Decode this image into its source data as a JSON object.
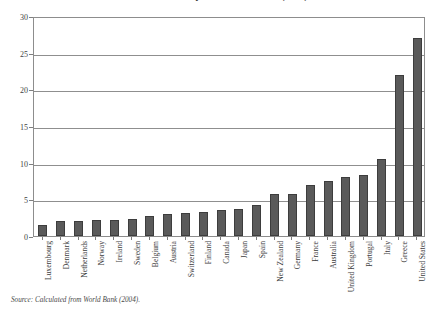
{
  "chart_data": {
    "type": "bar",
    "title": "Government Expenditure on Health (2001)",
    "xlabel": "",
    "ylabel": "",
    "ylim": [
      0,
      30
    ],
    "yticks": [
      0,
      5,
      10,
      15,
      20,
      25,
      30
    ],
    "grid": true,
    "legend": null,
    "source_note": "Source: Calculated from World Bank (2004).",
    "bar_color": "#5a5a5a",
    "bar_edge_color": "#3d3d3d",
    "axis_color": "#8d8d8d",
    "categories": [
      "Luxembourg",
      "Denmark",
      "Netherlands",
      "Norway",
      "Ireland",
      "Sweden",
      "Belgium",
      "Austria",
      "Switzerland",
      "Finland",
      "Canada",
      "Japan",
      "Spain",
      "New Zealand",
      "Germany",
      "France",
      "Australia",
      "United Kingdom",
      "Portugal",
      "Italy",
      "Greece",
      "United States"
    ],
    "values": [
      1.5,
      2.0,
      2.1,
      2.2,
      2.2,
      2.3,
      2.7,
      3.0,
      3.1,
      3.3,
      3.5,
      3.7,
      4.3,
      5.8,
      5.8,
      7.0,
      7.5,
      8.0,
      8.3,
      10.5,
      22.0,
      27.0
    ]
  },
  "source": {
    "text": "Source: Calculated from World Bank (2004)."
  }
}
